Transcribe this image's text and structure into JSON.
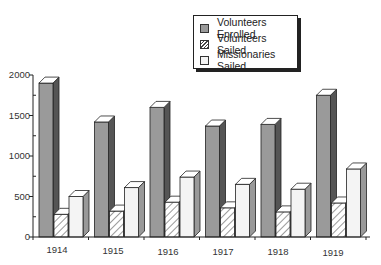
{
  "chart_data": {
    "type": "bar",
    "title": "",
    "xlabel": "",
    "ylabel": "",
    "ylim": [
      0,
      2000
    ],
    "yticks": [
      "0",
      "500",
      "1000",
      "1500",
      "2000"
    ],
    "categories": [
      "1914",
      "1915",
      "1916",
      "1917",
      "1918",
      "1919"
    ],
    "series": [
      {
        "name": "Volunteers Enrolled",
        "values": [
          1900,
          1420,
          1600,
          1370,
          1390,
          1750
        ],
        "fill": "#9a9a9a"
      },
      {
        "name": "Volunteers Sailed",
        "values": [
          280,
          320,
          430,
          360,
          310,
          420
        ],
        "fill": "hatched"
      },
      {
        "name": "Missionaries Sailed",
        "values": [
          500,
          610,
          740,
          650,
          590,
          840
        ],
        "fill": "#f4f4f4"
      }
    ],
    "legend_position": "top-right",
    "grid": false,
    "style": "3d-bar"
  },
  "legend": {
    "items": [
      {
        "label": "Volunteers Enrolled"
      },
      {
        "label": "Volunteers Sailed"
      },
      {
        "label": "Missionaries Sailed"
      }
    ]
  },
  "axis": {
    "y": [
      "0",
      "500",
      "1000",
      "1500",
      "2000"
    ],
    "x": [
      "1914",
      "1915",
      "1916",
      "1917",
      "1918",
      "1919"
    ]
  }
}
